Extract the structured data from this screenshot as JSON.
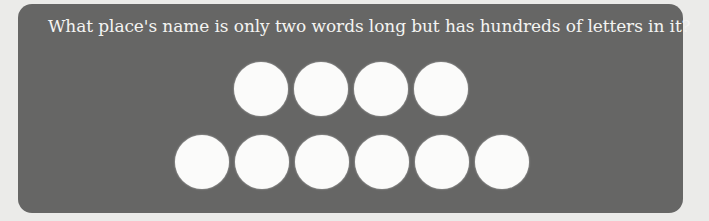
{
  "puzzle": {
    "question": "What place's name is only two words long but has hundreds of letters in it?",
    "answer_rows": [
      {
        "word_index": 1,
        "letter_count": 4
      },
      {
        "word_index": 2,
        "letter_count": 6
      }
    ],
    "colors": {
      "panel": "#666665",
      "text": "#f4f4f2",
      "blank": "#fbfbfa",
      "background": "#ebebe9"
    }
  }
}
